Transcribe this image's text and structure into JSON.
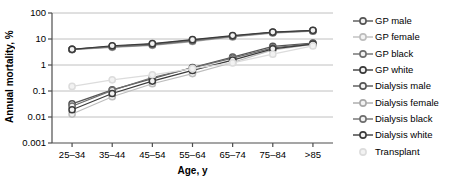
{
  "chart_data": {
    "type": "line",
    "title": "",
    "xlabel": "Age, y",
    "ylabel": "Annual mortality, %",
    "categories": [
      "25–34",
      "35–44",
      "45–54",
      "55–64",
      "65–74",
      "75–84",
      ">85"
    ],
    "ylim": [
      0.001,
      100
    ],
    "yticks": [
      "100",
      "10",
      "1",
      "0.1",
      "0.01",
      "0.001"
    ],
    "ytick_values": [
      100,
      10,
      1,
      0.1,
      0.01,
      0.001
    ],
    "yscale": "log",
    "grid": true,
    "legend_position": "right",
    "series": [
      {
        "name": "GP male",
        "color": "#555555",
        "values": [
          0.032,
          0.11,
          0.3,
          0.8,
          2.0,
          5.2,
          7.0
        ]
      },
      {
        "name": "GP female",
        "color": "#bdbdbd",
        "values": [
          0.013,
          0.06,
          0.19,
          0.47,
          1.25,
          3.8,
          6.2
        ]
      },
      {
        "name": "GP black",
        "color": "#6e6e6e",
        "values": [
          0.026,
          0.105,
          0.33,
          0.78,
          1.85,
          4.6,
          6.6
        ]
      },
      {
        "name": "GP white",
        "color": "#3b3b3b",
        "values": [
          0.019,
          0.08,
          0.24,
          0.62,
          1.55,
          4.2,
          6.4
        ]
      },
      {
        "name": "Dialysis male",
        "color": "#555555",
        "values": [
          4.0,
          5.2,
          6.3,
          9.0,
          13.0,
          18.0,
          21.0
        ]
      },
      {
        "name": "Dialysis female",
        "color": "#a8a8a8",
        "values": [
          3.9,
          4.8,
          5.7,
          8.0,
          12.0,
          17.0,
          20.0
        ]
      },
      {
        "name": "Dialysis black",
        "color": "#6e6e6e",
        "values": [
          4.0,
          5.0,
          6.0,
          8.5,
          12.5,
          17.5,
          20.5
        ]
      },
      {
        "name": "Dialysis white",
        "color": "#3b3b3b",
        "values": [
          4.0,
          5.5,
          6.6,
          9.4,
          13.5,
          18.5,
          21.5
        ]
      },
      {
        "name": "Transplant",
        "color": "#dcdcdc",
        "values": [
          0.15,
          0.27,
          0.42,
          0.72,
          1.2,
          2.6,
          5.4
        ]
      }
    ]
  },
  "legend": {
    "items": [
      "GP male",
      "GP female",
      "GP black",
      "GP white",
      "Dialysis male",
      "Dialysis female",
      "Dialysis black",
      "Dialysis white",
      "Transplant"
    ]
  },
  "axes": {
    "frame_color": "#4d4d4d",
    "grid_color": "#b0b0b0"
  }
}
